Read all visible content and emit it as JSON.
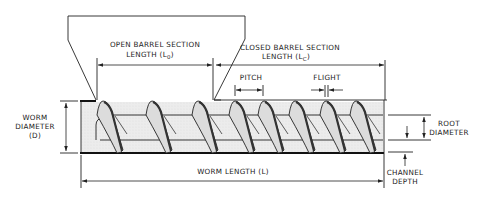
{
  "diagram": {
    "labels": {
      "open_barrel_line1": "OPEN BARREL SECTION",
      "open_barrel_line2": "LENGTH (L",
      "open_barrel_sub": "0",
      "closed_barrel_line1": "CLOSED BARREL SECTION",
      "closed_barrel_line2": "LENGTH (L",
      "closed_barrel_sub": "C",
      "close_paren": ")",
      "pitch": "PITCH",
      "flight": "FLIGHT",
      "worm_diameter_line1": "WORM",
      "worm_diameter_line2": "DIAMETER",
      "worm_diameter_line3": "(D)",
      "root_diameter_line1": "ROOT",
      "root_diameter_line2": "DIAMETER",
      "worm_length": "WORM LENGTH (L)",
      "channel_depth_line1": "CHANNEL",
      "channel_depth_line2": "DEPTH"
    },
    "colors": {
      "line": "#222222",
      "screw_fill": "#e6e6e6",
      "background": "#ffffff"
    },
    "flight_count": 8
  }
}
